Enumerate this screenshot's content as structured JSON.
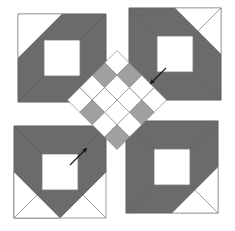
{
  "figure": {
    "width": 235,
    "height": 231,
    "background": "#ffffff"
  },
  "palette": {
    "white": "#ffffff",
    "dark_gray": "#6b6b6b",
    "mid_gray": "#a0a0a0",
    "light_gray": "#bdbdbd",
    "outline": "#808080",
    "arrow": "#101010"
  },
  "corner_blocks": [
    {
      "name": "top-left-block",
      "label": "Top left corner block",
      "x": 18,
      "y": 14,
      "size": 88,
      "band_color": "#6b6b6b",
      "center_color": "#ffffff",
      "corner_color": "#ffffff",
      "orientation": "nw"
    },
    {
      "name": "top-right-block",
      "label": "Top right corner block",
      "x": 129,
      "y": 8,
      "size": 92,
      "band_color": "#6b6b6b",
      "center_color": "#ffffff",
      "corner_color": "#ffffff",
      "orientation": "ne"
    },
    {
      "name": "bottom-left-block",
      "label": "Bottom left corner block",
      "x": 14,
      "y": 126,
      "size": 92,
      "band_color": "#6b6b6b",
      "center_color": "#ffffff",
      "corner_color": "#ffffff",
      "orientation": "sw"
    },
    {
      "name": "bottom-right-block",
      "label": "Bottom right corner block",
      "x": 126,
      "y": 121,
      "size": 92,
      "band_color": "#6b6b6b",
      "center_color": "#ffffff",
      "corner_color": "#ffffff",
      "orientation": "se"
    }
  ],
  "center_lattice": {
    "name": "center-diamond-lattice",
    "label": "Central on-point checkerboard lattice",
    "center_x": 117,
    "center_y": 100,
    "cell": 17.5,
    "grid": 4,
    "rotation_deg": 45,
    "cells": [
      [
        "white",
        "gray",
        "white",
        "white"
      ],
      [
        "gray",
        "white",
        "white",
        "gray"
      ],
      [
        "white",
        "white",
        "white",
        "white"
      ],
      [
        "white",
        "gray",
        "white",
        "gray"
      ]
    ]
  },
  "arrows": [
    {
      "name": "arrow-upper-right",
      "label": "Upper right assembly arrow",
      "from_x": 164,
      "from_y": 70,
      "to_x": 149,
      "to_y": 85,
      "color": "#101010"
    },
    {
      "name": "arrow-lower-left",
      "label": "Lower left assembly arrow",
      "from_x": 72,
      "from_y": 163,
      "to_x": 88,
      "to_y": 147,
      "color": "#101010"
    }
  ]
}
